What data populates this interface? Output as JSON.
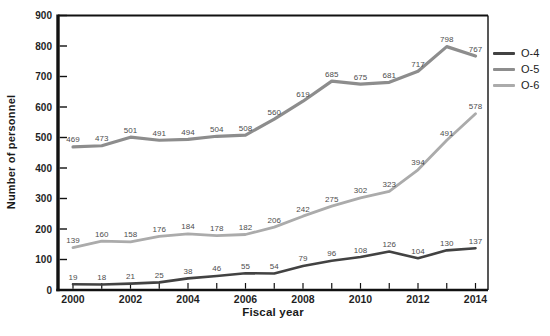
{
  "figure": {
    "background": "#ffffff",
    "axis_color": "#111111",
    "tick_label_color": "#1f1f1f",
    "data_label_color": "#4d4d4d",
    "ylabel": "Number of personnel",
    "xlabel": "Fiscal year"
  },
  "chart_data": {
    "type": "line",
    "title": "",
    "xlabel": "Fiscal year",
    "ylabel": "Number of personnel",
    "x": [
      2000,
      2001,
      2002,
      2003,
      2004,
      2005,
      2006,
      2007,
      2008,
      2009,
      2010,
      2011,
      2012,
      2013,
      2014
    ],
    "x_tick_label_step": 2,
    "ylim": [
      0,
      900
    ],
    "ytick_step": 100,
    "grid": false,
    "legend_position": "right",
    "series": [
      {
        "name": "O-4",
        "color": "#424242",
        "values": [
          19,
          18,
          21,
          25,
          38,
          46,
          55,
          54,
          79,
          96,
          108,
          126,
          104,
          130,
          137
        ]
      },
      {
        "name": "O-5",
        "color": "#8d8d8d",
        "values": [
          469,
          473,
          501,
          491,
          494,
          504,
          508,
          560,
          619,
          685,
          675,
          681,
          717,
          798,
          767
        ]
      },
      {
        "name": "O-6",
        "color": "#ababab",
        "values": [
          139,
          160,
          158,
          176,
          184,
          178,
          182,
          206,
          242,
          275,
          302,
          323,
          394,
          491,
          578
        ]
      }
    ]
  }
}
